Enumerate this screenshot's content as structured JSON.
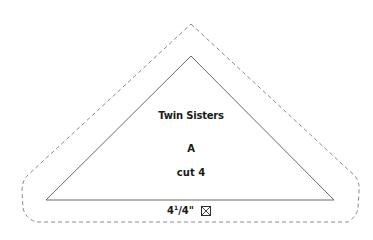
{
  "template": {
    "piece_name": "Twin Sisters",
    "piece_letter": "A",
    "cut_instruction": "cut 4",
    "dimension": {
      "whole": "4",
      "numerator": "1",
      "denominator": "4\"",
      "separator": "/"
    },
    "grain_icon": "boxed-x-icon"
  },
  "colors": {
    "stroke": "#6b6b6b",
    "dashed": "#8a8a8a",
    "text": "#1a1a1a",
    "background": "#ffffff"
  }
}
